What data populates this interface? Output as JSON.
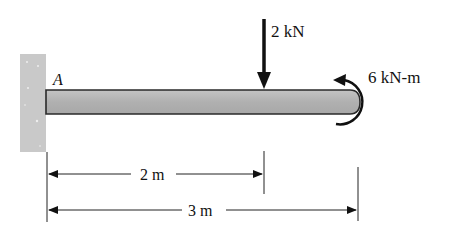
{
  "diagram": {
    "type": "cantilever-beam",
    "support": {
      "label": "A",
      "kind": "fixed-wall"
    },
    "loads": [
      {
        "kind": "point-force",
        "label": "2 kN",
        "direction": "down",
        "position_m": 2
      },
      {
        "kind": "couple-moment",
        "label": "6 kN-m",
        "direction": "counterclockwise",
        "position_m": 3
      }
    ],
    "dimensions": [
      {
        "label": "2 m",
        "from_m": 0,
        "to_m": 2
      },
      {
        "label": "3 m",
        "from_m": 0,
        "to_m": 3
      }
    ],
    "colors": {
      "beam_fill": "#b4b4b4",
      "beam_edge": "#2a2a2a",
      "wall_fill": "#c8c8c8",
      "ink": "#111111"
    }
  }
}
